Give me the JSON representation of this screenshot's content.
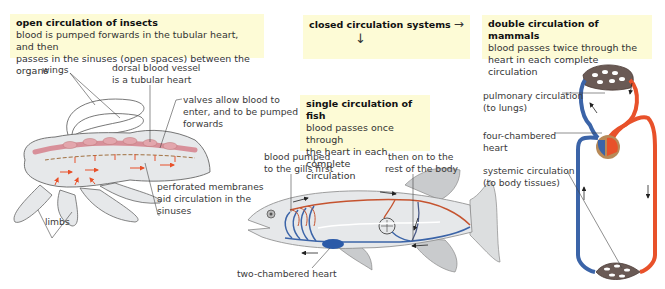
{
  "boxes": {
    "insects": {
      "title": "open circulation of insects",
      "line1": "blood is pumped forwards in the tubular heart, and then",
      "line2": "passes in the sinuses (open spaces) between the organs"
    },
    "closed": {
      "title": "closed circulation systems",
      "arrow_right": "→",
      "arrow_down": "↓"
    },
    "fish": {
      "title": "single circulation of fish",
      "line1": "blood passes once through",
      "line2": "the heart in each complete",
      "line3": "circulation"
    },
    "mammals": {
      "title": "double circulation of mammals",
      "line1": "blood passes twice through the",
      "line2": "heart in each complete circulation"
    }
  },
  "labels": {
    "insect": {
      "wings": "wings",
      "dorsal1": "dorsal blood vessel",
      "dorsal2": "is a tubular heart",
      "valves1": "valves allow blood to",
      "valves2": "enter, and to be pumped",
      "valves3": "forwards",
      "perf1": "perforated membranes",
      "perf2": "aid circulation in the",
      "perf3": "sinuses",
      "limbs": "limbs"
    },
    "fish": {
      "gills1": "blood pumped",
      "gills2": "to the gills first",
      "body1": "then on to the",
      "body2": "rest of the body",
      "heart": "two-chambered heart"
    },
    "mammal": {
      "pulm1": "pulmonary circulation",
      "pulm2": "(to lungs)",
      "heart1": "four-chambered",
      "heart2": "heart",
      "sys1": "systemic circulation",
      "sys2": "(to body tissues)"
    }
  },
  "colors": {
    "box_bg": "#fdfbd6",
    "oxygenated": "#e8512a",
    "deoxygenated": "#3b64a8",
    "body_fill": "#e6e8ea",
    "fin_fill": "#c9cbcd",
    "insect_heart": "#e3a6ad"
  }
}
